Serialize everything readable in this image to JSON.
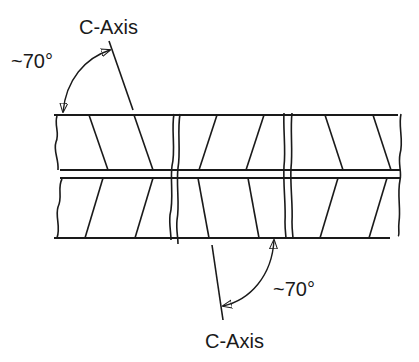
{
  "diagram": {
    "labels": {
      "top_axis": "C-Axis",
      "top_angle": "~70°",
      "bottom_axis": "C-Axis",
      "bottom_angle": "~70°"
    },
    "colors": {
      "stroke": "#1a1a1a",
      "background": "#ffffff"
    }
  }
}
